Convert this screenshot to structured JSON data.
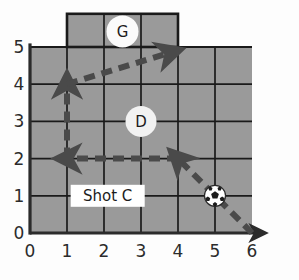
{
  "figure": {
    "field_color": "#9a9a9a",
    "grid_line_color": "#1a1a1a",
    "axis_color": "#2b2b2b",
    "arrow_color": "#4a4a4a",
    "label_box_color": "#ffffff",
    "marker_circle_color": "#f2f2f2"
  },
  "chart_data": {
    "type": "diagram",
    "title": "",
    "xlabel": "",
    "ylabel": "",
    "xlim": [
      0,
      6
    ],
    "ylim": [
      0,
      5
    ],
    "grid": true,
    "x_ticks": [
      "0",
      "1",
      "2",
      "3",
      "4",
      "5",
      "6"
    ],
    "y_ticks": [
      "0",
      "1",
      "2",
      "3",
      "4",
      "5"
    ],
    "x_tick_values": [
      0,
      1,
      2,
      3,
      4,
      5,
      6
    ],
    "y_tick_values": [
      0,
      1,
      2,
      3,
      4,
      5
    ],
    "x_axis_arrow": true,
    "y_axis_arrow": false,
    "regions": [
      {
        "name": "goal",
        "label": "G",
        "x_start": 1,
        "x_end": 4,
        "y_start": 5,
        "y_end": 6,
        "label_x": 2.5,
        "label_y": 5.5
      }
    ],
    "markers": [
      {
        "name": "defender",
        "label": "D",
        "x": 3,
        "y": 3
      },
      {
        "name": "ball",
        "label": "",
        "x": 5,
        "y": 1
      }
    ],
    "text_labels": [
      {
        "name": "shot-c",
        "label": "Shot C",
        "x": 2.1,
        "y": 1
      }
    ],
    "paths": [
      {
        "name": "ball-incoming",
        "style": "dashed",
        "arrow": true,
        "points": [
          [
            6,
            0
          ],
          [
            5,
            1
          ],
          [
            4,
            2
          ]
        ]
      },
      {
        "name": "pass-left",
        "style": "dashed",
        "arrow": true,
        "points": [
          [
            4,
            2
          ],
          [
            1,
            2
          ]
        ]
      },
      {
        "name": "run-up",
        "style": "dashed",
        "arrow": true,
        "points": [
          [
            1,
            2
          ],
          [
            1,
            4
          ]
        ]
      },
      {
        "name": "shot-to-goal",
        "style": "dashed",
        "arrow": true,
        "points": [
          [
            1,
            4
          ],
          [
            3.8,
            4.85
          ]
        ]
      }
    ]
  }
}
